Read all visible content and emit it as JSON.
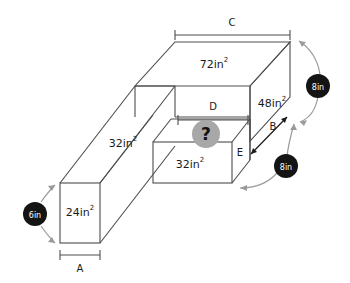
{
  "figure": {
    "background_color": "#ffffff",
    "edge_color": "#4c4c4c",
    "badge_color": "#141414",
    "badge_text_color": "#ffffff",
    "question_marker_color": "#a8a8a8",
    "arrow_color": "#9a9a9a"
  },
  "area_labels": {
    "top_face": "72in",
    "top_face_exp": "2",
    "right_face": "48in",
    "right_face_exp": "2",
    "long_bar_top": "32in",
    "long_bar_top_exp": "2",
    "small_box_front": "32in",
    "small_box_front_exp": "2",
    "long_bar_front": "24in",
    "long_bar_front_exp": "2"
  },
  "dimension_labels": {
    "c": "C",
    "d": "D",
    "b": "B",
    "e": "E",
    "a": "A"
  },
  "badges": [
    {
      "name": "badge-8in-upper",
      "text": "8in"
    },
    {
      "name": "badge-8in-lower",
      "text": "8in"
    },
    {
      "name": "badge-6in",
      "text": "6in"
    }
  ],
  "question_marker": {
    "text": "?"
  }
}
